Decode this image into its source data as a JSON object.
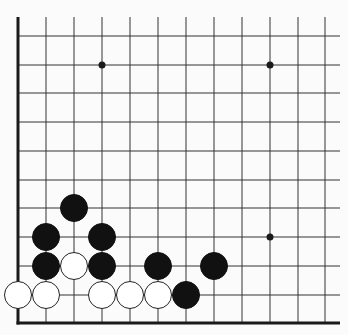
{
  "diagram": {
    "type": "go-board-corner",
    "colors": {
      "background": "#fbfbfb",
      "line": "#333333",
      "edge": "#1a1a1a",
      "black_stone": "#111111",
      "white_stone": "#ffffff",
      "white_stone_outline": "#222222",
      "hoshi": "#1a1a1a"
    },
    "grid": {
      "columns_x": [
        18,
        46,
        74,
        102,
        130,
        158,
        186,
        214,
        242,
        270,
        298,
        325
      ],
      "rows_y": [
        36,
        65,
        93,
        122,
        151,
        180,
        208,
        237,
        266,
        295,
        323
      ],
      "vertical_top": 17,
      "horizontal_right": 340,
      "left_edge_thick": true,
      "bottom_edge_thick": true
    },
    "hoshi_points": [
      {
        "col": 3,
        "row": 1
      },
      {
        "col": 9,
        "row": 1
      },
      {
        "col": 9,
        "row": 7
      }
    ],
    "stones": [
      {
        "color": "black",
        "col": 2,
        "row": 6
      },
      {
        "color": "black",
        "col": 1,
        "row": 7
      },
      {
        "color": "black",
        "col": 3,
        "row": 7
      },
      {
        "color": "black",
        "col": 1,
        "row": 8
      },
      {
        "color": "white",
        "col": 2,
        "row": 8
      },
      {
        "color": "black",
        "col": 3,
        "row": 8
      },
      {
        "color": "black",
        "col": 5,
        "row": 8
      },
      {
        "color": "black",
        "col": 7,
        "row": 8
      },
      {
        "color": "white",
        "col": 0,
        "row": 9
      },
      {
        "color": "white",
        "col": 1,
        "row": 9
      },
      {
        "color": "white",
        "col": 3,
        "row": 9
      },
      {
        "color": "white",
        "col": 4,
        "row": 9
      },
      {
        "color": "white",
        "col": 5,
        "row": 9
      },
      {
        "color": "black",
        "col": 6,
        "row": 9
      }
    ],
    "stone_radius": 13.5,
    "hoshi_radius": 3.5
  }
}
